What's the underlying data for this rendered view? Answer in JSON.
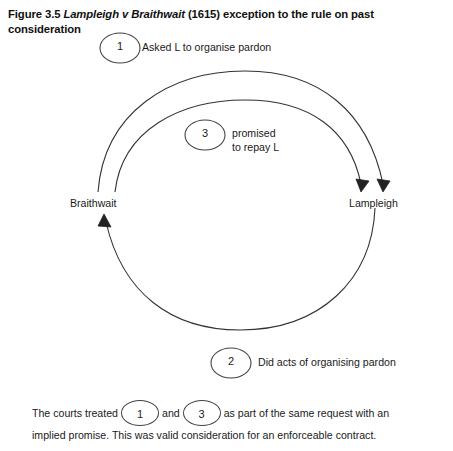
{
  "figure": {
    "label": "Figure 3.5",
    "case_name": "Lampleigh v Braithwait",
    "caption_rest": "(1615) exception to the rule on past consideration"
  },
  "diagram": {
    "nodes": {
      "left": "Braithwait",
      "right": "Lampleigh"
    },
    "steps": [
      {
        "number": "1",
        "label": "Asked L to organise pardon"
      },
      {
        "number": "3",
        "label_line1": "promised",
        "label_line2": "to repay L"
      },
      {
        "number": "2",
        "label": "Did acts of organising pardon"
      }
    ],
    "stroke_color": "#333333"
  },
  "bottom_note": {
    "part1": "The courts treated",
    "circle1": "1",
    "part2": "and",
    "circle2": "3",
    "part3": "as part of the same request with an",
    "line2": "implied promise. This was valid consideration for an enforceable contract."
  }
}
